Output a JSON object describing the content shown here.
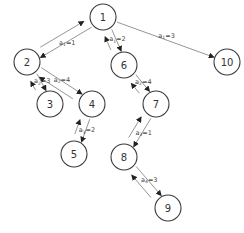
{
  "diagram": {
    "type": "tree",
    "nodes": [
      {
        "id": "1",
        "label": "1",
        "x": 103,
        "y": 17
      },
      {
        "id": "2",
        "label": "2",
        "x": 27,
        "y": 62
      },
      {
        "id": "3",
        "label": "3",
        "x": 50,
        "y": 104
      },
      {
        "id": "4",
        "label": "4",
        "x": 92,
        "y": 104
      },
      {
        "id": "5",
        "label": "5",
        "x": 74,
        "y": 154
      },
      {
        "id": "6",
        "label": "6",
        "x": 124,
        "y": 65
      },
      {
        "id": "7",
        "label": "7",
        "x": 156,
        "y": 104
      },
      {
        "id": "8",
        "label": "8",
        "x": 124,
        "y": 157
      },
      {
        "id": "9",
        "label": "9",
        "x": 168,
        "y": 208
      },
      {
        "id": "10",
        "label": "10",
        "x": 227,
        "y": 62
      }
    ],
    "edges": [
      {
        "from": "1",
        "to": "2",
        "var": "a",
        "sub": "1",
        "value": "=1",
        "bidirectional": true
      },
      {
        "from": "2",
        "to": "3",
        "var": "a",
        "sub": "2",
        "value": "=3",
        "bidirectional": true
      },
      {
        "from": "2",
        "to": "4",
        "var": "a",
        "sub": "2",
        "value": "=4",
        "bidirectional": true
      },
      {
        "from": "4",
        "to": "5",
        "var": "a",
        "sub": "3",
        "value": "=2",
        "bidirectional": true
      },
      {
        "from": "1",
        "to": "6",
        "var": "a",
        "sub": "1",
        "value": "=2",
        "bidirectional": true
      },
      {
        "from": "1",
        "to": "10",
        "var": "a",
        "sub": "1",
        "value": "=3",
        "bidirectional": false
      },
      {
        "from": "6",
        "to": "7",
        "var": "a",
        "sub": "2",
        "value": "=4",
        "bidirectional": true
      },
      {
        "from": "7",
        "to": "8",
        "var": "a",
        "sub": "3",
        "value": "=1",
        "bidirectional": true
      },
      {
        "from": "8",
        "to": "9",
        "var": "a",
        "sub": "4",
        "value": "=3",
        "bidirectional": true
      }
    ],
    "colors": {
      "node_stroke": "#3a3a3a",
      "edge": "#7a7a7a",
      "text": "#333333"
    }
  }
}
